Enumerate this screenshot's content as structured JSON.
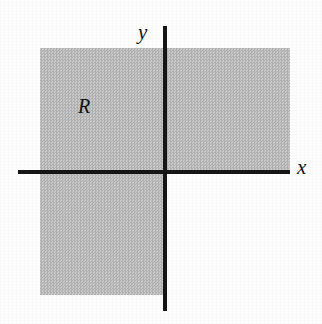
{
  "figure": {
    "type": "cartesian-plane-shaded-region",
    "caption": "",
    "background_color": "#fdfdfd",
    "shade_color": "#bdbdbd",
    "axis_color": "#151515",
    "label_color": "#141414"
  },
  "axes": {
    "x_label": "x",
    "y_label": "y",
    "x_axis_name": "horizontal-axis",
    "y_axis_name": "vertical-axis",
    "show_ticks": false,
    "show_tick_labels": false,
    "show_grid": false
  },
  "region": {
    "label": "R",
    "description": "shaded region covering quadrants I, II and III",
    "shaded_quadrants": [
      1,
      2,
      3
    ],
    "unshaded_quadrants": [
      4
    ]
  },
  "chart_data": {
    "type": "area",
    "title": "",
    "xlabel": "x",
    "ylabel": "y",
    "grid": false,
    "legend": null,
    "annotations": [
      {
        "text": "R",
        "x": -1.0,
        "y": 0.6
      },
      {
        "text": "y",
        "x": -0.12,
        "y": 1.18
      },
      {
        "text": "x",
        "x": 1.1,
        "y": 0.05
      }
    ],
    "shaded_rectangles": [
      {
        "name": "upper-band",
        "x0": -1.0,
        "x1": 1.0,
        "y0": 0.0,
        "y1": 1.0
      },
      {
        "name": "lower-left-block",
        "x0": -1.0,
        "x1": 0.0,
        "y0": -1.0,
        "y1": 0.0
      }
    ],
    "xlim": [
      -1.18,
      1.22
    ],
    "ylim": [
      -1.18,
      1.28
    ]
  }
}
